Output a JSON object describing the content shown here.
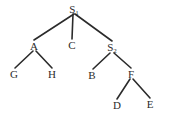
{
  "figure": {
    "kind": "syntax-tree-diagram",
    "width": 172,
    "height": 122,
    "background_color": "#ffffff",
    "stroke_color": "#2b2b2b",
    "text_color": "#2b2b2b"
  },
  "nodes": [
    {
      "id": "S1",
      "label": "S",
      "subscript": "1",
      "x": 74,
      "y": 9,
      "role": "root"
    },
    {
      "id": "A",
      "label": "A",
      "subscript": "",
      "x": 34,
      "y": 46,
      "role": "internal"
    },
    {
      "id": "C",
      "label": "C",
      "subscript": "",
      "x": 72,
      "y": 45,
      "role": "leaf"
    },
    {
      "id": "S2",
      "label": "S",
      "subscript": "2",
      "x": 112,
      "y": 47,
      "role": "internal"
    },
    {
      "id": "G",
      "label": "G",
      "subscript": "",
      "x": 14,
      "y": 74,
      "role": "leaf"
    },
    {
      "id": "H",
      "label": "H",
      "subscript": "",
      "x": 52,
      "y": 74,
      "role": "leaf"
    },
    {
      "id": "B",
      "label": "B",
      "subscript": "",
      "x": 92,
      "y": 75,
      "role": "leaf"
    },
    {
      "id": "F",
      "label": "F",
      "subscript": "",
      "x": 131,
      "y": 74,
      "role": "internal"
    },
    {
      "id": "D",
      "label": "D",
      "subscript": "",
      "x": 117,
      "y": 105,
      "role": "leaf"
    },
    {
      "id": "E",
      "label": "E",
      "subscript": "",
      "x": 150,
      "y": 104,
      "role": "leaf"
    }
  ],
  "edges": [
    {
      "id": "S1-A",
      "from": "S1",
      "to": "A",
      "x1": 74,
      "y1": 14,
      "x2": 34,
      "y2": 40
    },
    {
      "id": "S1-C",
      "from": "S1",
      "to": "C",
      "x1": 73,
      "y1": 14,
      "x2": 72,
      "y2": 39
    },
    {
      "id": "S1-S2",
      "from": "S1",
      "to": "S2",
      "x1": 75,
      "y1": 14,
      "x2": 112,
      "y2": 41
    },
    {
      "id": "A-G",
      "from": "A",
      "to": "G",
      "x1": 33,
      "y1": 51,
      "x2": 15,
      "y2": 68
    },
    {
      "id": "A-H",
      "from": "A",
      "to": "H",
      "x1": 36,
      "y1": 51,
      "x2": 52,
      "y2": 68
    },
    {
      "id": "S2-B",
      "from": "S2",
      "to": "B",
      "x1": 110,
      "y1": 53,
      "x2": 93,
      "y2": 69
    },
    {
      "id": "S2-F",
      "from": "S2",
      "to": "F",
      "x1": 114,
      "y1": 53,
      "x2": 131,
      "y2": 68
    },
    {
      "id": "F-D",
      "from": "F",
      "to": "D",
      "x1": 130,
      "y1": 79,
      "x2": 117,
      "y2": 99
    },
    {
      "id": "F-E",
      "from": "F",
      "to": "E",
      "x1": 133,
      "y1": 79,
      "x2": 150,
      "y2": 98
    }
  ]
}
